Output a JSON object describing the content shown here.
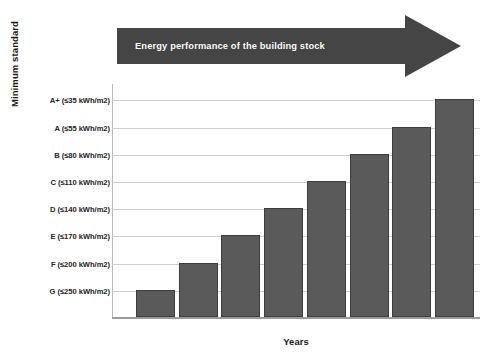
{
  "chart_data": {
    "type": "bar",
    "title": "",
    "xlabel": "Years",
    "ylabel": "Minimum standard",
    "grid": true,
    "legend": "none",
    "categories": [
      "1",
      "2",
      "3",
      "4",
      "5",
      "6",
      "7",
      "8"
    ],
    "y_tick_labels": [
      "A+ (≤35 kWh/m2)",
      "A (≤55 kWh/m2)",
      "B (≤80 kWh/m2)",
      "C (≤110 kWh/m2)",
      "D (≤140 kWh/m2)",
      "E (≤170 kWh/m2)",
      "F (≤200 kWh/m2)",
      "G (≤250 kWh/m2)"
    ],
    "y_tick_values": [
      8,
      7,
      6,
      5,
      4,
      3,
      2,
      1
    ],
    "ylim": [
      0,
      8.6
    ],
    "values": [
      1,
      2,
      3,
      4,
      5,
      6,
      7,
      8
    ],
    "value_labels": [
      "G (≤250 kWh/m2)",
      "F (≤200 kWh/m2)",
      "E (≤170 kWh/m2)",
      "D (≤140 kWh/m2)",
      "C (≤110 kWh/m2)",
      "B (≤80 kWh/m2)",
      "A (≤55 kWh/m2)",
      "A+ (≤35 kWh/m2)"
    ],
    "bar_color": "#5a5a5a",
    "bar_edge_color": "#3d3d3d",
    "gridline_color": "#cfcfcf",
    "annotations": [
      {
        "name": "energy-performance-arrow",
        "text": "Energy performance of the building stock",
        "shape": "right-arrow",
        "color": "#454545",
        "text_color": "#ffffff"
      }
    ]
  },
  "axes": {
    "y_title": "Minimum standard",
    "x_title": "Years"
  },
  "annotation": {
    "arrow_text": "Energy performance of the building stock"
  }
}
